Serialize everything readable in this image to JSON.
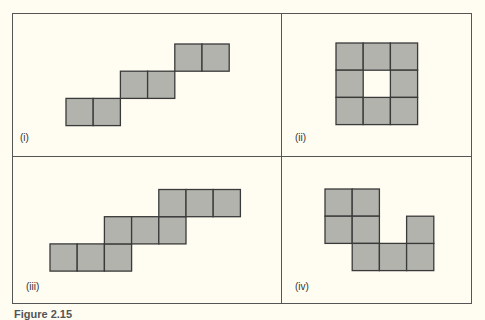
{
  "colors": {
    "fill": "#b3b3ad",
    "stroke": "#3a3a3a",
    "frame": "#555555",
    "background": "#fffdf2"
  },
  "panels": [
    {
      "label": "(i)",
      "cells": [
        [
          0,
          2
        ],
        [
          1,
          2
        ],
        [
          2,
          1
        ],
        [
          3,
          1
        ],
        [
          4,
          0
        ],
        [
          5,
          0
        ]
      ]
    },
    {
      "label": "(ii)",
      "cells": [
        [
          0,
          0
        ],
        [
          1,
          0
        ],
        [
          2,
          0
        ],
        [
          0,
          1
        ],
        [
          2,
          1
        ],
        [
          0,
          2
        ],
        [
          1,
          2
        ],
        [
          2,
          2
        ]
      ]
    },
    {
      "label": "(iii)",
      "cells": [
        [
          0,
          2
        ],
        [
          1,
          2
        ],
        [
          2,
          2
        ],
        [
          2,
          1
        ],
        [
          3,
          1
        ],
        [
          4,
          1
        ],
        [
          4,
          0
        ],
        [
          5,
          0
        ],
        [
          6,
          0
        ]
      ]
    },
    {
      "label": "(iv)",
      "cells": [
        [
          0,
          0
        ],
        [
          1,
          0
        ],
        [
          0,
          1
        ],
        [
          1,
          1
        ],
        [
          1,
          2
        ],
        [
          2,
          2
        ],
        [
          3,
          2
        ],
        [
          3,
          1
        ]
      ]
    }
  ],
  "caption": "Figure 2.15"
}
